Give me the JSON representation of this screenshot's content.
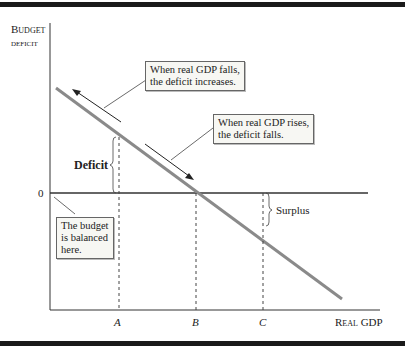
{
  "axes": {
    "y_label_line1": "Budget",
    "y_label_line2": "deficit",
    "x_label": "Real GDP",
    "zero_label": "0"
  },
  "ticks": {
    "a": "A",
    "b": "B",
    "c": "C"
  },
  "annotations": {
    "falls_line1": "When real GDP falls,",
    "falls_line2": "the deficit increases.",
    "rises_line1": "When real GDP rises,",
    "rises_line2": "the deficit falls.",
    "balanced_line1": "The budget",
    "balanced_line2": "is balanced",
    "balanced_line3": "here.",
    "deficit": "Deficit",
    "surplus": "Surplus"
  },
  "colors": {
    "line": "#8a8a8a",
    "axis": "#333333",
    "box_bg": "#f7f7f3"
  }
}
